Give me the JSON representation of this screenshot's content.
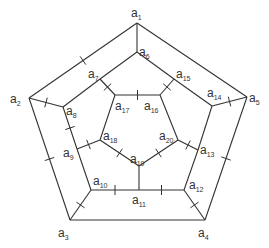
{
  "diagram": {
    "type": "graph",
    "colors": {
      "stroke": "#333333",
      "background": "#ffffff"
    },
    "vertices": [
      {
        "id": "a1",
        "base": "a",
        "sub": "1",
        "x": 137,
        "y": 23,
        "lx": 131,
        "ly": 17
      },
      {
        "id": "a2",
        "base": "a",
        "sub": "2",
        "x": 29,
        "y": 98,
        "lx": 10,
        "ly": 103
      },
      {
        "id": "a3",
        "base": "a",
        "sub": "3",
        "x": 70,
        "y": 220,
        "lx": 58,
        "ly": 237
      },
      {
        "id": "a4",
        "base": "a",
        "sub": "4",
        "x": 205,
        "y": 220,
        "lx": 198,
        "ly": 237
      },
      {
        "id": "a5",
        "base": "a",
        "sub": "5",
        "x": 247,
        "y": 97,
        "lx": 249,
        "ly": 102
      },
      {
        "id": "a6",
        "base": "a",
        "sub": "6",
        "x": 137,
        "y": 52,
        "lx": 139,
        "ly": 56
      },
      {
        "id": "a7",
        "base": "a",
        "sub": "7",
        "x": 100,
        "y": 79,
        "lx": 88,
        "ly": 78
      },
      {
        "id": "a8",
        "base": "a",
        "sub": "8",
        "x": 63,
        "y": 107,
        "lx": 66,
        "ly": 115
      },
      {
        "id": "a9",
        "base": "a",
        "sub": "9",
        "x": 77,
        "y": 149,
        "lx": 63,
        "ly": 157
      },
      {
        "id": "a10",
        "base": "a",
        "sub": "10",
        "x": 91,
        "y": 190,
        "lx": 93,
        "ly": 185
      },
      {
        "id": "a11",
        "base": "a",
        "sub": "11",
        "x": 139,
        "y": 190,
        "lx": 132,
        "ly": 204
      },
      {
        "id": "a12",
        "base": "a",
        "sub": "12",
        "x": 184,
        "y": 190,
        "lx": 189,
        "ly": 189
      },
      {
        "id": "a13",
        "base": "a",
        "sub": "13",
        "x": 198,
        "y": 150,
        "lx": 200,
        "ly": 154
      },
      {
        "id": "a14",
        "base": "a",
        "sub": "14",
        "x": 212,
        "y": 106,
        "lx": 207,
        "ly": 97
      },
      {
        "id": "a15",
        "base": "a",
        "sub": "15",
        "x": 174,
        "y": 79,
        "lx": 176,
        "ly": 78
      },
      {
        "id": "a16",
        "base": "a",
        "sub": "16",
        "x": 160,
        "y": 95,
        "lx": 144,
        "ly": 110
      },
      {
        "id": "a17",
        "base": "a",
        "sub": "17",
        "x": 115,
        "y": 95,
        "lx": 115,
        "ly": 110
      },
      {
        "id": "a18",
        "base": "a",
        "sub": "18",
        "x": 100,
        "y": 140,
        "lx": 103,
        "ly": 140
      },
      {
        "id": "a19",
        "base": "a",
        "sub": "19",
        "x": 139,
        "y": 166,
        "lx": 130,
        "ly": 163
      },
      {
        "id": "a20",
        "base": "a",
        "sub": "20",
        "x": 178,
        "y": 140,
        "lx": 159,
        "ly": 140
      }
    ],
    "edges": [
      {
        "from": "a1",
        "to": "a2",
        "tick": true
      },
      {
        "from": "a2",
        "to": "a3",
        "tick": true
      },
      {
        "from": "a3",
        "to": "a4",
        "tick": false
      },
      {
        "from": "a4",
        "to": "a5",
        "tick": true
      },
      {
        "from": "a5",
        "to": "a1",
        "tick": false
      },
      {
        "from": "a6",
        "to": "a7",
        "tick": false
      },
      {
        "from": "a7",
        "to": "a8",
        "tick": false
      },
      {
        "from": "a8",
        "to": "a9",
        "tick": true
      },
      {
        "from": "a9",
        "to": "a10",
        "tick": false
      },
      {
        "from": "a10",
        "to": "a11",
        "tick": true
      },
      {
        "from": "a11",
        "to": "a12",
        "tick": true
      },
      {
        "from": "a12",
        "to": "a13",
        "tick": false
      },
      {
        "from": "a13",
        "to": "a14",
        "tick": false
      },
      {
        "from": "a14",
        "to": "a15",
        "tick": false
      },
      {
        "from": "a15",
        "to": "a6",
        "tick": false
      },
      {
        "from": "a16",
        "to": "a17",
        "tick": true
      },
      {
        "from": "a17",
        "to": "a18",
        "tick": false
      },
      {
        "from": "a18",
        "to": "a19",
        "tick": true
      },
      {
        "from": "a19",
        "to": "a20",
        "tick": true
      },
      {
        "from": "a20",
        "to": "a16",
        "tick": false
      },
      {
        "from": "a1",
        "to": "a6",
        "tick": false
      },
      {
        "from": "a2",
        "to": "a8",
        "tick": true
      },
      {
        "from": "a3",
        "to": "a10",
        "tick": true
      },
      {
        "from": "a4",
        "to": "a12",
        "tick": true
      },
      {
        "from": "a5",
        "to": "a14",
        "tick": true
      },
      {
        "from": "a7",
        "to": "a17",
        "tick": true
      },
      {
        "from": "a15",
        "to": "a16",
        "tick": true
      },
      {
        "from": "a9",
        "to": "a18",
        "tick": true
      },
      {
        "from": "a13",
        "to": "a20",
        "tick": true
      },
      {
        "from": "a11",
        "to": "a19",
        "tick": false
      }
    ]
  }
}
